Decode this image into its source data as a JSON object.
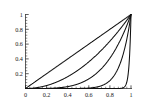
{
  "figure": {
    "name": "power-function-family-plot",
    "background_color": "#ffffff",
    "curve_color": "#111111",
    "axis_color": "#1a1a1a"
  },
  "chart_data": {
    "type": "line",
    "title": "",
    "subtitle": "",
    "xlabel": "",
    "ylabel": "",
    "xlim": [
      0,
      1
    ],
    "ylim": [
      0,
      1
    ],
    "grid": false,
    "legend": false,
    "legend_position": "none",
    "xticks": [
      0,
      0.2,
      0.4,
      0.6,
      0.8,
      1
    ],
    "xtick_labels": [
      "0",
      "0.2",
      "0.4",
      "0.6",
      "0.8",
      "1"
    ],
    "yticks": [
      0.2,
      0.4,
      0.6,
      0.8,
      1
    ],
    "ytick_labels": [
      "0.2",
      "0.4",
      "0.6",
      "0.8",
      "1"
    ],
    "minor_ticks_per_interval": 4,
    "x": [
      0,
      0.05,
      0.1,
      0.15,
      0.2,
      0.25,
      0.3,
      0.35,
      0.4,
      0.45,
      0.5,
      0.55,
      0.6,
      0.65,
      0.7,
      0.75,
      0.8,
      0.85,
      0.9,
      0.95,
      0.98,
      1
    ],
    "series": [
      {
        "name": "x^1",
        "exponent": 1,
        "values": [
          0,
          0.05,
          0.1,
          0.15,
          0.2,
          0.25,
          0.3,
          0.35,
          0.4,
          0.45,
          0.5,
          0.55,
          0.6,
          0.65,
          0.7,
          0.75,
          0.8,
          0.85,
          0.9,
          0.95,
          0.98,
          1
        ]
      },
      {
        "name": "x^2",
        "exponent": 2,
        "values": [
          0,
          0.0025,
          0.01,
          0.0225,
          0.04,
          0.0625,
          0.09,
          0.1225,
          0.16,
          0.2025,
          0.25,
          0.3025,
          0.36,
          0.4225,
          0.49,
          0.5625,
          0.64,
          0.7225,
          0.81,
          0.9025,
          0.9604,
          1
        ]
      },
      {
        "name": "x^4",
        "exponent": 4,
        "values": [
          0,
          6.25e-06,
          0.0001,
          0.00050625,
          0.0016,
          0.00390625,
          0.0081,
          0.01500625,
          0.0256,
          0.04100625,
          0.0625,
          0.09150625,
          0.1296,
          0.17850625,
          0.2401,
          0.31640625,
          0.4096,
          0.52200625,
          0.6561,
          0.81450625,
          0.92236816,
          1
        ]
      },
      {
        "name": "x^10",
        "exponent": 10,
        "values": [
          0,
          0.0,
          0.0,
          0.0,
          1e-07,
          9.5e-07,
          5.9e-06,
          2.76e-05,
          0.000105,
          0.00034,
          0.000977,
          0.00253,
          0.006047,
          0.013463,
          0.028248,
          0.056314,
          0.107374,
          0.196874,
          0.348678,
          0.598737,
          0.817073,
          1
        ]
      },
      {
        "name": "x^60",
        "exponent": 60,
        "values": [
          0,
          0.0,
          0.0,
          0.0,
          0.0,
          0.0,
          0.0,
          0.0,
          0.0,
          0.0,
          0.0,
          0.0,
          0.0,
          0.0,
          0.0,
          0.0,
          1.5e-06,
          5.02e-05,
          0.001797,
          0.045794,
          0.297517,
          1
        ]
      }
    ]
  }
}
